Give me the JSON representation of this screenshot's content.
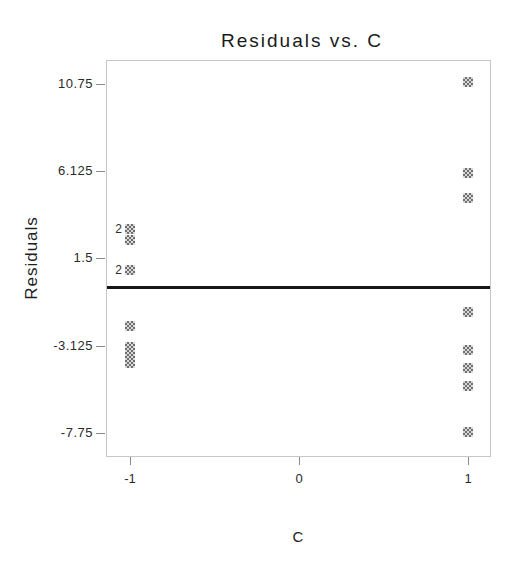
{
  "window": {
    "width": 513,
    "height": 565,
    "background": "#ffffff"
  },
  "chart_data": {
    "type": "scatter",
    "title": "Residuals vs. C",
    "xlabel": "C",
    "ylabel": "Residuals",
    "x_tick_labels": [
      "-1",
      "0",
      "1"
    ],
    "x_tick_values": [
      -1,
      0,
      1
    ],
    "y_tick_labels": [
      "10.75",
      "6.125",
      "1.5",
      "-3.125",
      "-7.75"
    ],
    "y_tick_values": [
      10.75,
      6.125,
      1.5,
      -3.125,
      -7.75
    ],
    "xlim": [
      -1.14,
      1.12
    ],
    "ylim": [
      -8.9,
      12.0
    ],
    "grid": false,
    "legend": false,
    "reference_line_y": 0,
    "series": [
      {
        "x": -1,
        "points": [
          {
            "value": 3.05,
            "count": 2
          },
          {
            "value": 2.5,
            "count": 1
          },
          {
            "value": 0.9,
            "count": 2
          },
          {
            "value": -2.1,
            "count": 1
          },
          {
            "value": -3.2,
            "count": 1
          },
          {
            "value": -3.6,
            "count": 1
          },
          {
            "value": -4.05,
            "count": 1
          }
        ]
      },
      {
        "x": 1,
        "points": [
          {
            "value": 10.85,
            "count": 1
          },
          {
            "value": 6.0,
            "count": 1
          },
          {
            "value": 4.7,
            "count": 1
          },
          {
            "value": -1.35,
            "count": 1
          },
          {
            "value": -3.35,
            "count": 1
          },
          {
            "value": -4.3,
            "count": 1
          },
          {
            "value": -5.25,
            "count": 1
          },
          {
            "value": -7.7,
            "count": 1
          }
        ]
      }
    ],
    "marker": {
      "shape": "dithered-square",
      "size_px": 10,
      "color_dark": "#6f6f6f",
      "color_light": "#d9d9d9"
    },
    "layout": {
      "plot_left": 106,
      "plot_top": 60,
      "plot_width": 383,
      "plot_height": 395,
      "x_origin_px": 299,
      "x_unit_px": 169,
      "y_top_value": 12.0,
      "y_px_per_unit": 18.9,
      "reference_line_thickness_px": 3,
      "frame_color": "#c6c6c6",
      "reference_line_color": "#161616",
      "tick_color": "#8a8a8a",
      "text_color": "#2a2a2a",
      "title_color": "#1a1a1a",
      "ylabel_center_px": [
        32,
        258
      ],
      "xlabel_center_px": [
        298,
        536
      ]
    }
  }
}
